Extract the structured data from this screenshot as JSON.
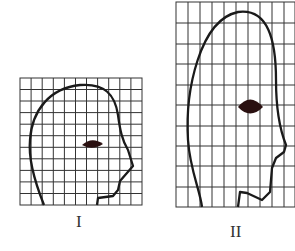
{
  "figures": [
    {
      "label": "I",
      "description": "Head profile on square grid, normal proportions",
      "grid": {
        "cols": 11,
        "rows": 11
      }
    },
    {
      "label": "II",
      "description": "Head profile on vertically stretched grid, elongated proportions",
      "grid": {
        "cols": 10,
        "rows": 17
      }
    }
  ],
  "colors": {
    "line": "#1a1a1a",
    "grid": "#333333",
    "eye": "#2a1010"
  }
}
